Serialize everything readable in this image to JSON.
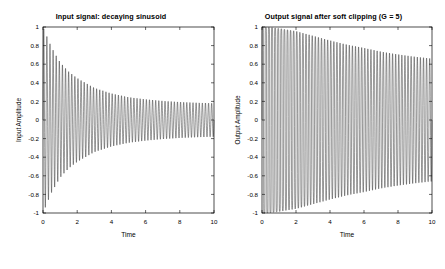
{
  "figure": {
    "background": "#ffffff",
    "width": 445,
    "height": 269,
    "line_color": "#1a1a1a",
    "axis_color": "#000000"
  },
  "chart_data": [
    {
      "type": "line",
      "panel": "left",
      "title": "Input signal: decaying sinusoid",
      "xlabel": "Time",
      "ylabel": "Input Amplitude",
      "xlim": [
        0,
        10
      ],
      "ylim": [
        -1,
        1
      ],
      "xticks": [
        0,
        2,
        4,
        6,
        8,
        10
      ],
      "xticklabels": [
        "0",
        "2",
        "4",
        "6",
        "8",
        "10"
      ],
      "yticks": [
        1,
        0.8,
        0.6,
        0.4,
        0.2,
        0,
        -0.2,
        -0.4,
        -0.6,
        -0.8,
        -1
      ],
      "yticklabels": [
        "1",
        "0.8",
        "0.6",
        "0.4",
        "0.2",
        "0",
        "-0.2",
        "-0.4",
        "-0.6",
        "-0.8",
        "-1"
      ],
      "grid": false,
      "legend": null,
      "series": [
        {
          "name": "input",
          "formula": "A(t) * sin(2*pi*f*t)",
          "frequency_hz": 5.5,
          "envelope_type": "exponential_decay_with_offset",
          "envelope_start": 1.0,
          "envelope_end": 0.18,
          "decay_rate": 0.62,
          "envelope_floor": 0.165,
          "samples": 2000
        }
      ],
      "envelope_points": [
        {
          "t": 0.0,
          "amp": 1.0
        },
        {
          "t": 0.5,
          "amp": 0.78
        },
        {
          "t": 1.0,
          "amp": 0.62
        },
        {
          "t": 1.5,
          "amp": 0.52
        },
        {
          "t": 2.0,
          "amp": 0.45
        },
        {
          "t": 3.0,
          "amp": 0.345
        },
        {
          "t": 4.0,
          "amp": 0.285
        },
        {
          "t": 5.0,
          "amp": 0.245
        },
        {
          "t": 6.0,
          "amp": 0.222
        },
        {
          "t": 7.0,
          "amp": 0.205
        },
        {
          "t": 8.0,
          "amp": 0.193
        },
        {
          "t": 9.0,
          "amp": 0.185
        },
        {
          "t": 10.0,
          "amp": 0.18
        }
      ]
    },
    {
      "type": "line",
      "panel": "right",
      "title": "Output signal after soft clipping (G = 5)",
      "xlabel": "Time",
      "ylabel": "Output Amplitude",
      "xlim": [
        0,
        10
      ],
      "ylim": [
        -1,
        1
      ],
      "xticks": [
        0,
        2,
        4,
        6,
        8,
        10
      ],
      "xticklabels": [
        "0",
        "2",
        "4",
        "6",
        "8",
        "10"
      ],
      "yticks": [
        1,
        0.8,
        0.6,
        0.4,
        0.2,
        0,
        -0.2,
        -0.4,
        -0.6,
        -0.8,
        -1
      ],
      "yticklabels": [
        "1",
        "0.8",
        "0.6",
        "0.4",
        "0.2",
        "0",
        "-0.2",
        "-0.4",
        "-0.6",
        "-0.8",
        "-1"
      ],
      "grid": false,
      "legend": null,
      "gain": 5,
      "series": [
        {
          "name": "output",
          "formula": "tanh(G * A(t) * sin(2*pi*f*t))",
          "frequency_hz": 5.5,
          "envelope_type": "tanh_saturated_decay",
          "envelope_start": 1.0,
          "envelope_end": 0.66,
          "samples": 2000
        }
      ],
      "envelope_points": [
        {
          "t": 0.0,
          "amp": 1.0
        },
        {
          "t": 0.5,
          "amp": 0.995
        },
        {
          "t": 1.0,
          "amp": 0.985
        },
        {
          "t": 1.5,
          "amp": 0.97
        },
        {
          "t": 2.0,
          "amp": 0.955
        },
        {
          "t": 3.0,
          "amp": 0.905
        },
        {
          "t": 4.0,
          "amp": 0.855
        },
        {
          "t": 5.0,
          "amp": 0.81
        },
        {
          "t": 6.0,
          "amp": 0.775
        },
        {
          "t": 7.0,
          "amp": 0.735
        },
        {
          "t": 8.0,
          "amp": 0.705
        },
        {
          "t": 9.0,
          "amp": 0.68
        },
        {
          "t": 10.0,
          "amp": 0.66
        }
      ]
    }
  ]
}
